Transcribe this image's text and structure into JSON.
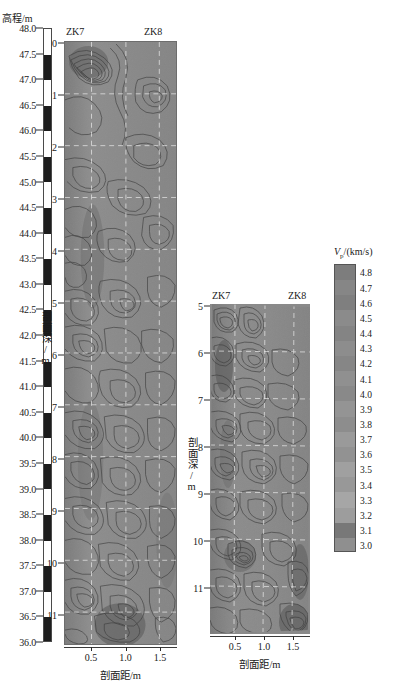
{
  "figure": {
    "kind": "seismic-crosshole-tomography",
    "elevation_axis": {
      "title": "高程/m",
      "unit": "m",
      "max": 48.0,
      "min": 36.0,
      "step": 0.5,
      "ticks": [
        "48.0",
        "47.5",
        "47.0",
        "46.5",
        "46.0",
        "45.5",
        "45.0",
        "44.5",
        "44.0",
        "43.5",
        "43.0",
        "42.5",
        "42.0",
        "41.5",
        "41.0",
        "40.5",
        "40.0",
        "39.5",
        "39.0",
        "38.5",
        "38.0",
        "37.5",
        "37.0",
        "36.5",
        "36.0"
      ]
    },
    "panels": [
      {
        "id": "panel-left",
        "borehole_left": "ZK7",
        "borehole_right": "ZK8",
        "y_caption": "剖面深/m",
        "x_caption": "剖面距/m",
        "y_ticks": [
          "0",
          "1",
          "2",
          "3",
          "4",
          "5",
          "6",
          "7",
          "8",
          "9",
          "10",
          "11"
        ],
        "y_range": [
          0,
          11.6
        ],
        "x_ticks": [
          "0.5",
          "1.0",
          "1.5"
        ],
        "x_range": [
          0.1,
          1.75
        ]
      },
      {
        "id": "panel-right",
        "borehole_left": "ZK7",
        "borehole_right": "ZK8",
        "y_caption": "剖面深/m",
        "x_caption": "剖面距/m",
        "y_ticks": [
          "5",
          "6",
          "7",
          "8",
          "9",
          "10",
          "11"
        ],
        "y_range": [
          5,
          11.6
        ],
        "x_ticks": [
          "0.5",
          "1.0",
          "1.5"
        ],
        "x_range": [
          0.1,
          1.75
        ]
      }
    ],
    "legend": {
      "title_symbol": "V",
      "title_sub": "p",
      "title_rest": "/(km/s)",
      "title_full": "Vp /(km/s)",
      "max": 4.8,
      "min": 3.0,
      "step": 0.1,
      "labels": [
        "4.8",
        "4.7",
        "4.6",
        "4.5",
        "4.4",
        "4.3",
        "4.2",
        "4.1",
        "4.0",
        "3.9",
        "3.8",
        "3.7",
        "3.6",
        "3.5",
        "3.4",
        "3.3",
        "3.2",
        "3.1",
        "3.0"
      ],
      "swatch_colors": [
        "#7d7d7d",
        "#868686",
        "#7f7f7f",
        "#8b8b8b",
        "#848484",
        "#8d8d8d",
        "#868686",
        "#909090",
        "#898989",
        "#949494",
        "#8d8d8d",
        "#9a9a9a",
        "#929292",
        "#a0a0a0",
        "#989898",
        "#a6a6a6",
        "#9d9d9d",
        "#787878",
        "#8f8f8f"
      ]
    },
    "colors": {
      "panel_background": "#8a8a8a",
      "contour_line": "#3f3f3f",
      "gridline": "#e8e8e8",
      "axis": "#2a2a2a",
      "scale_dark": "#1d1d1d",
      "scale_light": "#ffffff"
    }
  },
  "chart_data": {
    "type": "heatmap",
    "title": "",
    "xlabel": "剖面距/m",
    "ylabel": "剖面深/m",
    "colorbar_label": "Vp /(km/s)",
    "zlim": [
      3.0,
      4.8
    ],
    "grid": true,
    "legend_position": "right",
    "panels": [
      {
        "name": "panel-left",
        "xlim": [
          0.1,
          1.75
        ],
        "ylim": [
          0,
          11.6
        ],
        "xticks": [
          0.5,
          1.0,
          1.5
        ],
        "yticks": [
          0,
          1,
          2,
          3,
          4,
          5,
          6,
          7,
          8,
          9,
          10,
          11
        ],
        "annotations": [
          "ZK7",
          "ZK8"
        ],
        "low_velocity_zones": [
          {
            "x": 0.55,
            "y": 0.4,
            "note": "shallow low-Vp anomaly near ZK7"
          },
          {
            "x": 0.45,
            "y": 4.3,
            "note": "steep gradient band"
          },
          {
            "x": 0.5,
            "y": 8.2,
            "note": "dense contour cluster"
          },
          {
            "x": 1.05,
            "y": 11.2,
            "note": "basal low-Vp anomaly"
          }
        ]
      },
      {
        "name": "panel-right",
        "xlim": [
          0.1,
          1.75
        ],
        "ylim": [
          5,
          11.6
        ],
        "xticks": [
          0.5,
          1.0,
          1.5
        ],
        "yticks": [
          5,
          6,
          7,
          8,
          9,
          10,
          11
        ],
        "annotations": [
          "ZK7",
          "ZK8"
        ],
        "low_velocity_zones": [
          {
            "x": 0.3,
            "y": 6.0,
            "note": "dark low-Vp streak along ZK7"
          },
          {
            "x": 0.55,
            "y": 10.0,
            "note": "concentric anomaly"
          },
          {
            "x": 1.55,
            "y": 10.3,
            "note": "low-Vp streak near ZK8"
          },
          {
            "x": 1.45,
            "y": 11.4,
            "note": "basal anomaly near ZK8"
          }
        ]
      }
    ]
  }
}
